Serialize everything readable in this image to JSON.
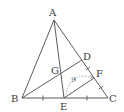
{
  "diagram": {
    "type": "geometry",
    "points": {
      "A": {
        "label": "A",
        "x": 54,
        "y": 20
      },
      "B": {
        "label": "B",
        "x": 22,
        "y": 98
      },
      "C": {
        "label": "C",
        "x": 108,
        "y": 98
      },
      "D": {
        "label": "D",
        "x": 82,
        "y": 60
      },
      "E": {
        "label": "E",
        "x": 64,
        "y": 98
      },
      "F": {
        "label": "F",
        "x": 94,
        "y": 78
      },
      "G": {
        "label": "G",
        "x": 61,
        "y": 72
      }
    },
    "segments": [
      [
        "A",
        "B"
      ],
      [
        "A",
        "C"
      ],
      [
        "B",
        "C"
      ],
      [
        "A",
        "E"
      ],
      [
        "B",
        "D"
      ],
      [
        "E",
        "F"
      ]
    ],
    "measure_label": "9",
    "colors": {
      "line": "#4a4a4a",
      "label": "#3a3a3a",
      "dashed": "#888888"
    }
  }
}
